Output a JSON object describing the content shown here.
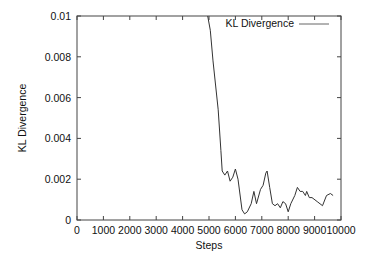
{
  "chart_data": {
    "type": "line",
    "title": "",
    "xlabel": "Steps",
    "ylabel": "KL Divergence",
    "xlim": [
      0,
      10000
    ],
    "ylim": [
      0,
      0.01
    ],
    "grid": false,
    "legend_position": "top-right",
    "x_ticks": [
      "0",
      "1000",
      "2000",
      "3000",
      "4000",
      "5000",
      "6000",
      "7000",
      "8000",
      "9000",
      "10000"
    ],
    "y_ticks": [
      "0",
      "0.002",
      "0.004",
      "0.006",
      "0.008",
      "0.01"
    ],
    "series": [
      {
        "name": "KL Divergence",
        "color": "#333333",
        "x": [
          4950,
          5050,
          5150,
          5350,
          5450,
          5500,
          5600,
          5700,
          5800,
          5900,
          6000,
          6100,
          6250,
          6350,
          6450,
          6600,
          6700,
          6800,
          6950,
          7050,
          7150,
          7200,
          7300,
          7400,
          7500,
          7600,
          7700,
          7800,
          7900,
          8000,
          8100,
          8250,
          8350,
          8450,
          8550,
          8650,
          8700,
          8800,
          8900,
          9100,
          9300,
          9450,
          9600,
          9700
        ],
        "values": [
          0.01,
          0.0093,
          0.0078,
          0.0054,
          0.0034,
          0.0024,
          0.0022,
          0.0024,
          0.0019,
          0.0021,
          0.0025,
          0.002,
          0.0005,
          0.0003,
          0.0004,
          0.0008,
          0.0014,
          0.0008,
          0.0015,
          0.0017,
          0.0023,
          0.0024,
          0.0016,
          0.0008,
          0.0007,
          0.0008,
          0.0006,
          0.0009,
          0.0008,
          0.0004,
          0.0008,
          0.0012,
          0.0016,
          0.0014,
          0.0014,
          0.0012,
          0.0014,
          0.0011,
          0.0011,
          0.0009,
          0.0007,
          0.0012,
          0.0013,
          0.0012
        ]
      }
    ]
  }
}
